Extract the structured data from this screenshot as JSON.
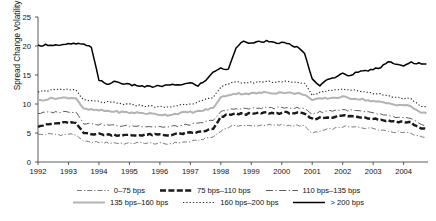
{
  "chart_data": {
    "type": "line",
    "title": "",
    "xlabel": "",
    "ylabel": "Spread Change Volatility (bps/month)",
    "xlim": [
      1992.0,
      2004.8
    ],
    "ylim": [
      0,
      25
    ],
    "yticks": [
      0,
      5,
      10,
      15,
      20,
      25
    ],
    "xticks": [
      1992,
      1993,
      1994,
      1995,
      1996,
      1997,
      1998,
      1999,
      2000,
      2001,
      2002,
      2003,
      2004
    ],
    "grid": false,
    "legend_position": "bottom",
    "x": [
      1992.0,
      1992.25,
      1992.5,
      1992.75,
      1993.0,
      1993.25,
      1993.5,
      1993.75,
      1994.0,
      1994.25,
      1994.5,
      1994.75,
      1995.0,
      1995.25,
      1995.5,
      1995.75,
      1996.0,
      1996.25,
      1996.5,
      1996.75,
      1997.0,
      1997.25,
      1997.5,
      1997.75,
      1998.0,
      1998.25,
      1998.5,
      1998.75,
      1999.0,
      1999.25,
      1999.5,
      1999.75,
      2000.0,
      2000.25,
      2000.5,
      2000.75,
      2001.0,
      2001.25,
      2001.5,
      2001.75,
      2002.0,
      2002.25,
      2002.5,
      2002.75,
      2003.0,
      2003.25,
      2003.5,
      2003.75,
      2004.0,
      2004.25,
      2004.5,
      2004.75
    ],
    "series": [
      {
        "name": "0–75 bps",
        "style": "dash-dot-thin",
        "color": "#7a7a7a",
        "values": [
          4.7,
          4.8,
          4.8,
          4.7,
          4.8,
          4.7,
          3.5,
          3.4,
          3.4,
          3.3,
          3.3,
          3.2,
          3.2,
          3.3,
          3.3,
          3.2,
          3.2,
          3.1,
          3.3,
          3.4,
          3.5,
          3.7,
          4.1,
          4.3,
          5.4,
          6.0,
          6.3,
          6.3,
          6.2,
          6.3,
          6.4,
          6.3,
          6.4,
          6.3,
          6.3,
          6.2,
          4.9,
          5.3,
          5.6,
          5.8,
          6.1,
          6.0,
          6.0,
          5.9,
          5.8,
          5.6,
          5.3,
          5.2,
          5.2,
          5.0,
          4.4,
          4.3
        ]
      },
      {
        "name": "75 bps–110 bps",
        "style": "dash-thick",
        "color": "#1a1a1a",
        "values": [
          6.2,
          6.4,
          6.6,
          6.7,
          6.8,
          6.7,
          5.0,
          4.9,
          4.8,
          4.7,
          4.7,
          4.6,
          4.6,
          4.6,
          4.7,
          4.7,
          4.7,
          4.6,
          4.8,
          4.9,
          5.0,
          5.1,
          5.4,
          5.7,
          7.7,
          8.2,
          8.3,
          8.3,
          8.3,
          8.4,
          8.5,
          8.4,
          8.5,
          8.5,
          8.4,
          8.3,
          7.4,
          7.6,
          7.7,
          7.8,
          8.0,
          7.9,
          7.8,
          7.7,
          7.5,
          7.3,
          7.1,
          7.0,
          6.9,
          6.8,
          5.9,
          5.8
        ]
      },
      {
        "name": "110 bps–135 bps",
        "style": "dash-dot-thin-long",
        "color": "#5a5a5a",
        "values": [
          8.4,
          8.5,
          8.6,
          8.6,
          8.7,
          8.6,
          6.7,
          6.6,
          6.5,
          6.4,
          6.3,
          6.2,
          6.2,
          6.2,
          6.2,
          6.1,
          6.1,
          6.0,
          6.2,
          6.3,
          6.5,
          6.6,
          6.9,
          7.2,
          8.6,
          9.0,
          9.2,
          9.2,
          9.2,
          9.3,
          9.4,
          9.3,
          9.4,
          9.4,
          9.3,
          9.2,
          8.3,
          8.6,
          8.8,
          8.9,
          9.0,
          8.9,
          8.8,
          8.6,
          8.4,
          8.2,
          7.9,
          7.7,
          7.6,
          7.4,
          6.6,
          6.4
        ]
      },
      {
        "name": "135 bps–160 bps",
        "style": "solid-gray",
        "color": "#b3b3b3",
        "values": [
          10.6,
          10.8,
          11.0,
          11.0,
          11.1,
          11.0,
          9.1,
          9.0,
          8.9,
          8.8,
          8.7,
          8.6,
          8.5,
          8.5,
          8.4,
          8.3,
          8.2,
          8.1,
          8.3,
          8.5,
          8.6,
          8.7,
          9.0,
          9.3,
          11.1,
          11.6,
          11.8,
          11.8,
          11.8,
          11.9,
          12.0,
          11.9,
          12.0,
          11.9,
          11.8,
          11.7,
          10.6,
          10.9,
          11.0,
          11.1,
          11.2,
          11.0,
          10.9,
          10.7,
          10.5,
          10.3,
          10.1,
          9.9,
          9.8,
          9.6,
          8.6,
          8.4
        ]
      },
      {
        "name": "160 bps–200 bps",
        "style": "dotted",
        "color": "#2a2a2a",
        "values": [
          12.2,
          12.3,
          12.4,
          12.4,
          12.5,
          12.4,
          10.6,
          10.5,
          10.4,
          10.3,
          10.2,
          10.0,
          9.9,
          9.8,
          9.7,
          9.6,
          9.5,
          9.4,
          9.7,
          9.9,
          10.1,
          10.3,
          10.7,
          11.1,
          13.0,
          13.5,
          13.7,
          13.7,
          13.7,
          13.8,
          13.9,
          13.8,
          13.9,
          13.8,
          13.7,
          13.6,
          11.6,
          12.0,
          12.3,
          12.5,
          12.6,
          12.4,
          12.3,
          12.1,
          11.9,
          11.7,
          11.4,
          11.2,
          11.0,
          10.8,
          9.7,
          9.5
        ]
      },
      {
        "name": "> 200 bps",
        "style": "solid-black",
        "color": "#000000",
        "values": [
          20.1,
          20.2,
          20.2,
          20.1,
          20.3,
          20.4,
          20.2,
          19.8,
          14.2,
          13.3,
          13.9,
          13.6,
          13.3,
          13.2,
          13.0,
          13.0,
          13.1,
          13.2,
          13.3,
          13.4,
          13.6,
          13.2,
          14.0,
          15.6,
          16.1,
          16.0,
          19.7,
          21.0,
          20.4,
          20.7,
          20.8,
          20.5,
          20.6,
          20.3,
          19.8,
          18.7,
          14.3,
          13.1,
          14.4,
          14.6,
          15.2,
          14.9,
          15.6,
          15.7,
          16.0,
          16.4,
          17.4,
          16.8,
          16.5,
          17.2,
          17.0,
          16.9
        ]
      }
    ]
  },
  "axes": {
    "ytick_labels": [
      "0",
      "5",
      "10",
      "15",
      "20",
      "25"
    ],
    "xtick_labels": [
      "1992",
      "1993",
      "1994",
      "1995",
      "1996",
      "1997",
      "1998",
      "1999",
      "2000",
      "2001",
      "2002",
      "2003",
      "2004"
    ],
    "ylabel": "Spread Change Volatility (bps/month)"
  },
  "legend": {
    "row1": [
      "0–75 bps",
      "75 bps–110 bps",
      "110 bps–135 bps"
    ],
    "row2": [
      "135 bps–160 bps",
      "160 bps–200 bps",
      "> 200 bps"
    ]
  }
}
